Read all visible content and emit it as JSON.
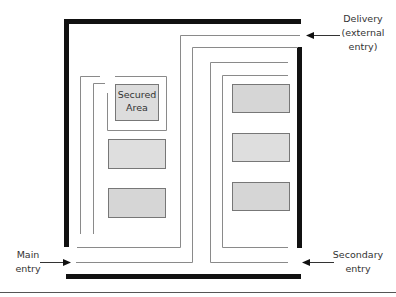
{
  "diagram": {
    "type": "floor-plan",
    "colors": {
      "wall": "#111111",
      "aisle_line": "#8a8a8a",
      "rack_fill": "#d9d9d9",
      "rack_stroke": "#777777",
      "secured_fill": "#dcdcdc",
      "text": "#333333"
    },
    "secured_area": {
      "line1": "Secured",
      "line2": "Area"
    },
    "labels": {
      "delivery": {
        "line1": "Delivery",
        "line2": "(external",
        "line3": "entry)"
      },
      "main_entry": {
        "line1": "Main",
        "line2": "entry"
      },
      "secondary_entry": {
        "line1": "Secondary",
        "line2": "entry"
      }
    },
    "racks": [
      {
        "id": "left-rack-1"
      },
      {
        "id": "left-rack-2"
      },
      {
        "id": "right-rack-1"
      },
      {
        "id": "right-rack-2"
      },
      {
        "id": "right-rack-3"
      }
    ]
  }
}
